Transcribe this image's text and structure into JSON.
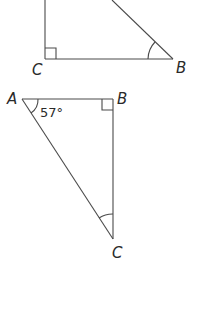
{
  "figure": {
    "triangle_1": {
      "vertices": {
        "C": "C",
        "B": "B"
      },
      "right_angle_at": "C",
      "marked_angle_at": "B"
    },
    "triangle_2": {
      "vertices": {
        "A": "A",
        "B": "B",
        "C": "C"
      },
      "right_angle_at": "B",
      "marked_angle_at": "C",
      "angle_A_label": "57°"
    },
    "line_color": "#4a4a4a",
    "text_color": "#2a2a2a"
  }
}
